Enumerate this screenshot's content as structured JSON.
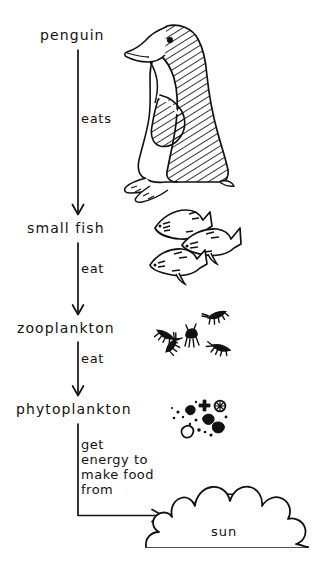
{
  "diagram": {
    "ink_color": "#111111",
    "background": "#ffffff",
    "nodes": [
      {
        "id": "penguin",
        "label": "penguin",
        "icon": "penguin-illustration"
      },
      {
        "id": "small-fish",
        "label": "small fish",
        "icon": "small-fish-illustration"
      },
      {
        "id": "zooplankton",
        "label": "zooplankton",
        "icon": "zooplankton-illustration"
      },
      {
        "id": "phytoplankton",
        "label": "phytoplankton",
        "icon": "phytoplankton-illustration"
      },
      {
        "id": "sun",
        "label": "sun",
        "icon": "sun-illustration"
      }
    ],
    "edges": [
      {
        "from": "penguin",
        "to": "small-fish",
        "label": "eats"
      },
      {
        "from": "small-fish",
        "to": "zooplankton",
        "label": "eat"
      },
      {
        "from": "zooplankton",
        "to": "phytoplankton",
        "label": "eat"
      },
      {
        "from": "phytoplankton",
        "to": "sun",
        "label": "get\nenergy to\nmake food\nfrom"
      }
    ]
  }
}
